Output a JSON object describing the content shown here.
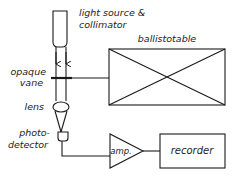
{
  "diagram": {
    "type": "block schematic",
    "colors": {
      "line": "#1a1a1a",
      "background": "#ffffff"
    },
    "labels": {
      "light_source_line1": "light source &",
      "light_source_line2": "collimator",
      "ballistotable": "ballistotable",
      "vane_line1": "opaque",
      "vane_line2": "vane",
      "lens": "lens",
      "detector_line1": "photo-",
      "detector_line2": "detector",
      "amp": "amp.",
      "recorder": "recorder"
    },
    "nodes": [
      {
        "id": "light-source",
        "label": "light source & collimator"
      },
      {
        "id": "opaque-vane",
        "label": "opaque vane"
      },
      {
        "id": "ballistotable",
        "label": "ballistotable"
      },
      {
        "id": "lens",
        "label": "lens"
      },
      {
        "id": "photodetector",
        "label": "photo-detector"
      },
      {
        "id": "amplifier",
        "label": "amp."
      },
      {
        "id": "recorder",
        "label": "recorder"
      }
    ],
    "edges": [
      {
        "from": "light-source",
        "to": "opaque-vane",
        "kind": "light beam"
      },
      {
        "from": "ballistotable",
        "to": "opaque-vane",
        "kind": "mechanical link"
      },
      {
        "from": "opaque-vane",
        "to": "lens",
        "kind": "light beam"
      },
      {
        "from": "lens",
        "to": "photodetector",
        "kind": "focused light"
      },
      {
        "from": "photodetector",
        "to": "amplifier",
        "kind": "signal"
      },
      {
        "from": "amplifier",
        "to": "recorder",
        "kind": "signal"
      }
    ]
  }
}
